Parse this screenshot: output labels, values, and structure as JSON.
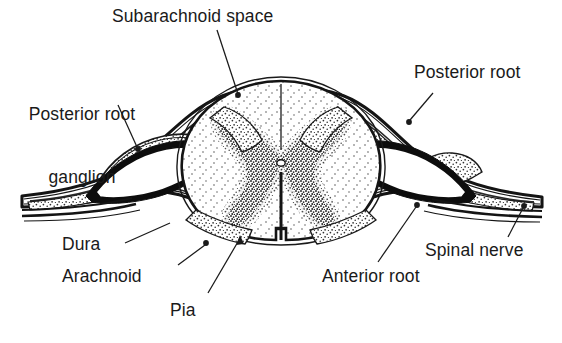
{
  "figure": {
    "background_color": "#ffffff",
    "ink_color": "#1a1a1a",
    "stipple_color": "#3a3a3a",
    "width": 562,
    "height": 343
  },
  "labels": {
    "subarachnoid_space": "Subarachnoid space",
    "posterior_root_ganglion_line1": "Posterior root",
    "posterior_root_ganglion_line2": "ganglion",
    "posterior_root": "Posterior root",
    "dura": "Dura",
    "arachnoid": "Arachnoid",
    "pia": "Pia",
    "anterior_root": "Anterior root",
    "spinal_nerve": "Spinal nerve"
  },
  "leaders": {
    "subarachnoid_space": {
      "from": [
        217,
        30
      ],
      "to": [
        238,
        96
      ],
      "endpoint": "dot"
    },
    "posterior_root_ganglion": {
      "from": [
        118,
        105
      ],
      "to": [
        138,
        149
      ],
      "endpoint": "dot"
    },
    "posterior_root": {
      "from": [
        432,
        94
      ],
      "to": [
        409,
        122
      ],
      "endpoint": "dot"
    },
    "dura": {
      "from": [
        125,
        243
      ],
      "to": [
        168,
        224
      ],
      "endpoint": "plain"
    },
    "arachnoid": {
      "from": [
        178,
        265
      ],
      "to": [
        206,
        243
      ],
      "endpoint": "dot"
    },
    "pia": {
      "from": [
        208,
        293
      ],
      "to": [
        240,
        237
      ],
      "endpoint": "arrow"
    },
    "anterior_root": {
      "from": [
        378,
        262
      ],
      "to": [
        417,
        205
      ],
      "endpoint": "dot"
    },
    "spinal_nerve": {
      "from": [
        508,
        237
      ],
      "to": [
        524,
        206
      ],
      "endpoint": "dot"
    }
  },
  "structures": [
    {
      "name": "dura-mater",
      "description": "outermost heavy black membrane enveloping cord and nerve roots"
    },
    {
      "name": "arachnoid-mater",
      "description": "thin membrane just inside dura"
    },
    {
      "name": "subarachnoid-space",
      "description": "space between arachnoid and pia, shown black at root sleeves"
    },
    {
      "name": "pia-mater",
      "description": "innermost membrane hugging the spinal cord"
    },
    {
      "name": "spinal-cord",
      "description": "central oval cord, white matter stippled lightly"
    },
    {
      "name": "gray-matter",
      "description": "butterfly shaped densely stippled gray matter"
    },
    {
      "name": "central-canal",
      "description": "small opening at center of gray matter commissure"
    },
    {
      "name": "anterior-median-fissure",
      "description": "deep ventral midline cleft"
    },
    {
      "name": "posterior-median-sulcus",
      "description": "dorsal midline line"
    },
    {
      "name": "posterior-root-ganglion-left",
      "description": "stippled swelling on dorsal root, left side"
    },
    {
      "name": "posterior-root-left",
      "description": "dorsal root entering cord from left"
    },
    {
      "name": "posterior-root-right",
      "description": "dorsal root entering cord from right"
    },
    {
      "name": "anterior-root-left",
      "description": "ventral root leaving cord to the left"
    },
    {
      "name": "anterior-root-right",
      "description": "ventral root leaving cord to the right"
    },
    {
      "name": "spinal-nerve-left",
      "description": "mixed nerve trunk exiting left"
    },
    {
      "name": "spinal-nerve-right",
      "description": "mixed nerve trunk exiting right"
    }
  ]
}
